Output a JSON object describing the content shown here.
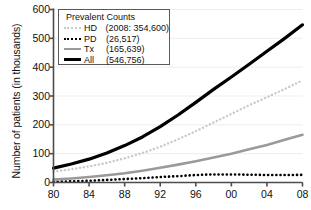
{
  "chart_data": {
    "type": "line",
    "title": "",
    "xlabel": "",
    "ylabel": "Number of patients (in thousands)",
    "legend_title": "Prevalent Counts",
    "legend_position": "top-left",
    "grid": true,
    "xlim": [
      1980,
      2008
    ],
    "ylim": [
      0,
      600
    ],
    "yticks": [
      "600",
      "500",
      "400",
      "300",
      "200",
      "100",
      "0"
    ],
    "ytick_values": [
      600,
      500,
      400,
      300,
      200,
      100,
      0
    ],
    "xticks": [
      "80",
      "84",
      "88",
      "92",
      "96",
      "00",
      "04",
      "08"
    ],
    "xtick_values": [
      1980,
      1984,
      1988,
      1992,
      1996,
      2000,
      2004,
      2008
    ],
    "x": [
      1980,
      1982,
      1984,
      1986,
      1988,
      1990,
      1992,
      1994,
      1996,
      1998,
      2000,
      2002,
      2004,
      2006,
      2008
    ],
    "series": [
      {
        "name": "HD",
        "label": "HD",
        "value_label": "(2008: 354,600)",
        "style": "dotted",
        "color": "#c9c9c9",
        "width": 2.4,
        "final_value": 354.6,
        "values": [
          38,
          46,
          56,
          68,
          84,
          102,
          124,
          150,
          178,
          208,
          238,
          268,
          296,
          324,
          354.6
        ]
      },
      {
        "name": "PD",
        "label": "PD",
        "value_label": "(26,517)",
        "style": "dotted",
        "color": "#000000",
        "width": 2.6,
        "final_value": 26.5,
        "values": [
          2,
          4,
          6,
          9,
          12,
          15,
          19,
          22,
          26,
          28,
          28,
          27,
          26,
          26,
          26.5
        ]
      },
      {
        "name": "Tx",
        "label": "Tx",
        "value_label": "(165,639)",
        "style": "solid",
        "color": "#9a9a9a",
        "width": 2.6,
        "final_value": 165.6,
        "values": [
          10,
          14,
          19,
          25,
          32,
          41,
          51,
          62,
          74,
          87,
          100,
          115,
          130,
          148,
          165.6
        ]
      },
      {
        "name": "All",
        "label": "All",
        "value_label": "(546,756)",
        "style": "solid",
        "color": "#000000",
        "width": 3.2,
        "final_value": 546.8,
        "values": [
          50,
          64,
          81,
          102,
          128,
          158,
          194,
          234,
          278,
          323,
          366,
          410,
          455,
          500,
          546.8
        ]
      }
    ]
  },
  "colors": {
    "background": "#ffffff",
    "axis": "#4d4d4d",
    "grid": "#ededed",
    "legend_border": "#5a5a5a",
    "text": "#111111"
  }
}
